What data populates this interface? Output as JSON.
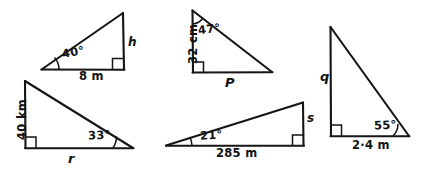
{
  "figure": {
    "ink_color": "#151515",
    "background": "#ffffff",
    "triangle_count": 5
  },
  "triangles": [
    {
      "id": "triangle-1",
      "position": "top-left",
      "angle_label": "40°",
      "base_label": "8 m",
      "vertical_label": "h",
      "right_angle": true,
      "right_angle_corner": "bottom-right"
    },
    {
      "id": "triangle-2",
      "position": "top-middle",
      "angle_label": "47°",
      "vertical_label": "32 cm",
      "base_label": "P",
      "right_angle": true,
      "right_angle_corner": "bottom-left"
    },
    {
      "id": "triangle-3",
      "position": "bottom-left",
      "angle_label": "33°",
      "vertical_label": "40 km",
      "base_label": "r",
      "right_angle": true,
      "right_angle_corner": "bottom-left"
    },
    {
      "id": "triangle-4",
      "position": "bottom-middle",
      "angle_label": "21°",
      "base_label": "285 m",
      "vertical_label": "s",
      "right_angle": true,
      "right_angle_corner": "bottom-right"
    },
    {
      "id": "triangle-5",
      "position": "right",
      "angle_label": "55°",
      "vertical_label": "q",
      "base_label": "2·4 m",
      "right_angle": true,
      "right_angle_corner": "bottom-left"
    }
  ]
}
